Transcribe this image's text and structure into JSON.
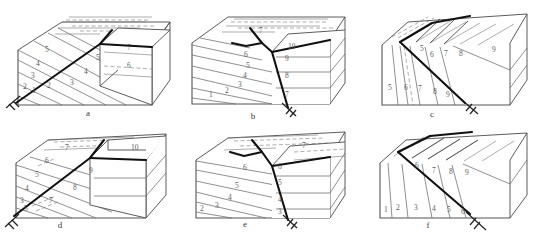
{
  "figure": {
    "panel_count": 6,
    "stroke_colors": {
      "fault": "#111111",
      "bedding": "#6b6b6b",
      "block_edge": "#4a4a4a",
      "label_text": "#5d5d5d",
      "background": "#ffffff"
    }
  },
  "panels": [
    {
      "id": "a",
      "label": "a",
      "label_pos": {
        "x": 88,
        "y": 116
      },
      "fault_style": "normal-fault-planar",
      "has_slip_marker": true,
      "slip_marker_pos": {
        "x": 14,
        "y": 99
      },
      "front_face_layers": [
        {
          "text": "1",
          "x": 32,
          "y": 93
        },
        {
          "text": "2",
          "x": 47,
          "y": 88
        },
        {
          "text": "3",
          "x": 31,
          "y": 78
        },
        {
          "text": "4",
          "x": 36,
          "y": 66
        },
        {
          "text": "5",
          "x": 45,
          "y": 52
        },
        {
          "text": "2",
          "x": 23,
          "y": 89
        },
        {
          "text": "3",
          "x": 70,
          "y": 85
        },
        {
          "text": "4",
          "x": 84,
          "y": 74
        },
        {
          "text": "5",
          "x": 96,
          "y": 60
        }
      ],
      "upper_block_layers": [
        {
          "text": "7",
          "x": 127,
          "y": 50
        },
        {
          "text": "6",
          "x": 127,
          "y": 68
        }
      ]
    },
    {
      "id": "b",
      "label": "b",
      "label_pos": {
        "x": 253,
        "y": 119
      },
      "fault_style": "listric-normal-fault",
      "has_slip_marker": true,
      "slip_marker_pos": {
        "x": 282,
        "y": 109
      },
      "front_face_layers": [
        {
          "text": "1",
          "x": 209,
          "y": 97
        },
        {
          "text": "2",
          "x": 225,
          "y": 93
        },
        {
          "text": "3",
          "x": 238,
          "y": 87
        },
        {
          "text": "4",
          "x": 243,
          "y": 78
        },
        {
          "text": "5",
          "x": 246,
          "y": 68
        },
        {
          "text": "6",
          "x": 244,
          "y": 57
        },
        {
          "text": "7",
          "x": 259,
          "y": 33
        }
      ],
      "upper_block_layers": [
        {
          "text": "10",
          "x": 288,
          "y": 49
        },
        {
          "text": "9",
          "x": 285,
          "y": 61
        },
        {
          "text": "8",
          "x": 285,
          "y": 78
        },
        {
          "text": "7",
          "x": 285,
          "y": 97
        }
      ]
    },
    {
      "id": "c",
      "label": "c",
      "label_pos": {
        "x": 432,
        "y": 117
      },
      "fault_style": "normal-fault-steep-beds",
      "has_slip_marker": true,
      "slip_marker_pos": {
        "x": 470,
        "y": 106
      },
      "front_face_layers": [
        {
          "text": "5",
          "x": 388,
          "y": 90
        },
        {
          "text": "6",
          "x": 404,
          "y": 90
        },
        {
          "text": "7",
          "x": 418,
          "y": 91
        },
        {
          "text": "8",
          "x": 433,
          "y": 94
        },
        {
          "text": "9",
          "x": 446,
          "y": 97
        }
      ],
      "upper_block_layers": [
        {
          "text": "5",
          "x": 420,
          "y": 51
        },
        {
          "text": "6",
          "x": 430,
          "y": 57
        },
        {
          "text": "7",
          "x": 444,
          "y": 56
        },
        {
          "text": "8",
          "x": 459,
          "y": 56
        },
        {
          "text": "9",
          "x": 492,
          "y": 52
        }
      ]
    },
    {
      "id": "d",
      "label": "d",
      "label_pos": {
        "x": 60,
        "y": 228
      },
      "fault_style": "normal-fault-offset-beds",
      "has_slip_marker": true,
      "slip_marker_pos": {
        "x": 14,
        "y": 218
      },
      "front_face_layers": [
        {
          "text": "3",
          "x": 20,
          "y": 203
        },
        {
          "text": "4",
          "x": 25,
          "y": 191
        },
        {
          "text": "5",
          "x": 35,
          "y": 177
        },
        {
          "text": "6",
          "x": 45,
          "y": 163
        },
        {
          "text": "5",
          "x": 24,
          "y": 211
        },
        {
          "text": "7",
          "x": 49,
          "y": 203
        },
        {
          "text": "8",
          "x": 73,
          "y": 190
        },
        {
          "text": "7",
          "x": 65,
          "y": 150
        }
      ],
      "upper_block_layers": [
        {
          "text": "9",
          "x": 89,
          "y": 173
        },
        {
          "text": "10",
          "x": 131,
          "y": 150
        }
      ]
    },
    {
      "id": "e",
      "label": "e",
      "label_pos": {
        "x": 245,
        "y": 227
      },
      "fault_style": "listric-fault-rollover",
      "has_slip_marker": true,
      "slip_marker_pos": {
        "x": 278,
        "y": 222
      },
      "front_face_layers": [
        {
          "text": "2",
          "x": 200,
          "y": 211
        },
        {
          "text": "3",
          "x": 215,
          "y": 208
        },
        {
          "text": "4",
          "x": 228,
          "y": 200
        },
        {
          "text": "5",
          "x": 235,
          "y": 188
        },
        {
          "text": "6",
          "x": 243,
          "y": 170
        },
        {
          "text": "7",
          "x": 302,
          "y": 148
        }
      ],
      "upper_block_layers": [
        {
          "text": "6",
          "x": 278,
          "y": 169
        },
        {
          "text": "5",
          "x": 278,
          "y": 185
        },
        {
          "text": "4",
          "x": 278,
          "y": 202
        },
        {
          "text": "3",
          "x": 278,
          "y": 214
        }
      ]
    },
    {
      "id": "f",
      "label": "f",
      "label_pos": {
        "x": 428,
        "y": 228
      },
      "fault_style": "normal-fault-steep-beds-2",
      "has_slip_marker": true,
      "slip_marker_pos": {
        "x": 480,
        "y": 227
      },
      "front_face_layers": [
        {
          "text": "1",
          "x": 384,
          "y": 212
        },
        {
          "text": "2",
          "x": 396,
          "y": 210
        },
        {
          "text": "3",
          "x": 414,
          "y": 210
        },
        {
          "text": "4",
          "x": 432,
          "y": 211
        },
        {
          "text": "5",
          "x": 447,
          "y": 212
        },
        {
          "text": "6",
          "x": 461,
          "y": 214
        }
      ],
      "upper_block_layers": [
        {
          "text": "6",
          "x": 415,
          "y": 168
        },
        {
          "text": "7",
          "x": 432,
          "y": 173
        },
        {
          "text": "8",
          "x": 449,
          "y": 174
        },
        {
          "text": "9",
          "x": 465,
          "y": 175
        }
      ]
    }
  ]
}
